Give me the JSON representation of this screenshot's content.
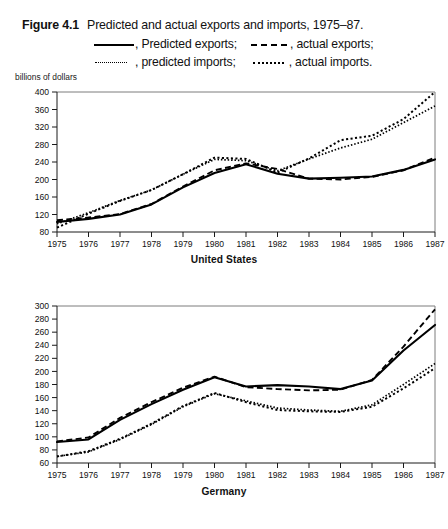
{
  "caption": {
    "figure_number": "Figure 4.1",
    "title": "Predicted and actual exports and imports, 1975–87.",
    "legend": [
      {
        "key": "predicted-exports",
        "style": "solid",
        "label": ", Predicted exports;"
      },
      {
        "key": "actual-exports",
        "style": "dashed",
        "label": ", actual exports;"
      },
      {
        "key": "predicted-imports",
        "style": "fine-dotted",
        "label": ", predicted imports;"
      },
      {
        "key": "actual-imports",
        "style": "dotted",
        "label": ", actual imports."
      }
    ]
  },
  "units_label": "billions of dollars",
  "chart_data": [
    {
      "type": "line",
      "title": "United States",
      "xlabel": "United States",
      "ylabel": "billions of dollars",
      "x": [
        1975,
        1976,
        1977,
        1978,
        1979,
        1980,
        1981,
        1982,
        1983,
        1984,
        1985,
        1986,
        1987
      ],
      "xtick_labels": [
        "1975",
        "1976",
        "1977",
        "1978",
        "1979",
        "1980",
        "1981",
        "1982",
        "1983",
        "1984",
        "1985",
        "1986",
        "1987"
      ],
      "ylim": [
        80,
        400
      ],
      "yticks": [
        80,
        120,
        160,
        200,
        240,
        280,
        320,
        360,
        400
      ],
      "grid": false,
      "legend_position": "above-figure",
      "series": [
        {
          "name": "Predicted exports",
          "style": "solid",
          "values": [
            103,
            110,
            120,
            143,
            182,
            215,
            235,
            213,
            202,
            204,
            207,
            222,
            246
          ]
        },
        {
          "name": "actual exports",
          "style": "dashed",
          "values": [
            107,
            113,
            121,
            144,
            184,
            221,
            237,
            224,
            202,
            200,
            206,
            221,
            250
          ]
        },
        {
          "name": "predicted imports",
          "style": "fine-dotted",
          "values": [
            99,
            124,
            152,
            176,
            212,
            246,
            243,
            220,
            247,
            272,
            292,
            330,
            368
          ]
        },
        {
          "name": "actual imports",
          "style": "dotted",
          "values": [
            90,
            122,
            151,
            176,
            212,
            250,
            247,
            216,
            248,
            290,
            300,
            338,
            400
          ]
        }
      ]
    },
    {
      "type": "line",
      "title": "Germany",
      "xlabel": "Germany",
      "ylabel": "billions of dollars",
      "x": [
        1975,
        1976,
        1977,
        1978,
        1979,
        1980,
        1981,
        1982,
        1983,
        1984,
        1985,
        1986,
        1987
      ],
      "xtick_labels": [
        "1975",
        "1976",
        "1977",
        "1978",
        "1979",
        "1980",
        "1981",
        "1982",
        "1983",
        "1984",
        "1985",
        "1986",
        "1987"
      ],
      "ylim": [
        60,
        300
      ],
      "yticks": [
        60,
        80,
        100,
        120,
        140,
        160,
        180,
        200,
        220,
        240,
        260,
        280,
        300
      ],
      "grid": false,
      "legend_position": "above-figure",
      "series": [
        {
          "name": "Predicted exports",
          "style": "solid",
          "values": [
            92,
            96,
            126,
            150,
            172,
            191,
            177,
            179,
            177,
            173,
            186,
            232,
            271
          ]
        },
        {
          "name": "actual exports",
          "style": "dashed",
          "values": [
            93,
            99,
            129,
            153,
            175,
            192,
            176,
            173,
            171,
            172,
            187,
            238,
            295
          ]
        },
        {
          "name": "predicted imports",
          "style": "fine-dotted",
          "values": [
            70,
            77,
            96,
            119,
            146,
            166,
            155,
            144,
            141,
            139,
            149,
            180,
            212
          ]
        },
        {
          "name": "actual imports",
          "style": "dotted",
          "values": [
            70,
            78,
            97,
            120,
            147,
            167,
            153,
            141,
            139,
            138,
            146,
            174,
            205
          ]
        }
      ]
    }
  ]
}
